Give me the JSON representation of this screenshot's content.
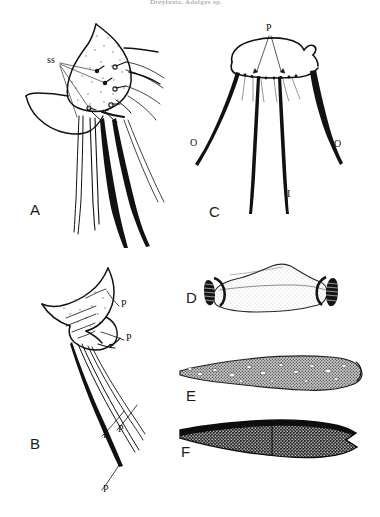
{
  "figure": {
    "header_note": "Dreyfusia, Adelges sp.",
    "background_color": "#ffffff",
    "ink_color": "#111111",
    "width": 380,
    "height": 517
  },
  "panels": [
    {
      "id": "A",
      "letter": "A",
      "letter_pos": {
        "x": 30,
        "y": 202
      },
      "caption_kind": "lateral view of terminal abdominal segments with long setae",
      "labels": [
        {
          "text": "ss",
          "x": 47,
          "y": 60,
          "leaders": 4
        }
      ]
    },
    {
      "id": "B",
      "letter": "B",
      "letter_pos": {
        "x": 30,
        "y": 443
      },
      "caption_kind": "lateral view of terminal abdomen with processes",
      "labels": [
        {
          "text": "P",
          "x": 122,
          "y": 303
        },
        {
          "text": "P",
          "x": 127,
          "y": 337
        },
        {
          "text": "P",
          "x": 104,
          "y": 434
        },
        {
          "text": "P",
          "x": 119,
          "y": 428
        },
        {
          "text": "P",
          "x": 104,
          "y": 488
        }
      ]
    },
    {
      "id": "C",
      "letter": "C",
      "letter_pos": {
        "x": 209,
        "y": 206
      },
      "caption_kind": "ventral view of cauda with outer and inner setae",
      "labels": [
        {
          "text": "P",
          "x": 268,
          "y": 28
        },
        {
          "text": "O",
          "x": 192,
          "y": 142
        },
        {
          "text": "O",
          "x": 335,
          "y": 143
        },
        {
          "text": "I",
          "x": 251,
          "y": 192
        },
        {
          "text": "I",
          "x": 287,
          "y": 192
        }
      ]
    },
    {
      "id": "D",
      "letter": "D",
      "letter_pos": {
        "x": 186,
        "y": 298
      },
      "caption_kind": "stippled plate with dark ribbed ends",
      "labels": []
    },
    {
      "id": "E",
      "letter": "E",
      "letter_pos": {
        "x": 186,
        "y": 396
      },
      "caption_kind": "elongate structure with coarse stippling and pale pores",
      "labels": []
    },
    {
      "id": "F",
      "letter": "F",
      "letter_pos": {
        "x": 181,
        "y": 452
      },
      "caption_kind": "elongate structure with dark reticulate sculpture and notched apex",
      "labels": []
    }
  ]
}
